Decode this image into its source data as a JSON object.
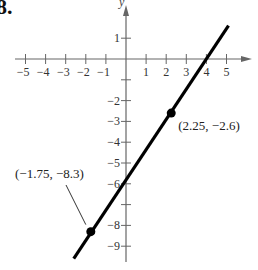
{
  "problem_number": "8.",
  "chart_data": {
    "type": "line",
    "title": "",
    "xlabel": "",
    "ylabel": "y",
    "xlim": [
      -5.5,
      5.5
    ],
    "ylim": [
      -9.5,
      1.5
    ],
    "x_ticks": [
      -5,
      -4,
      -3,
      -2,
      -1,
      1,
      2,
      3,
      4,
      5
    ],
    "x_tick_labels": [
      "−5",
      "−4",
      "−3",
      "−2",
      "−1",
      "1",
      "2",
      "3",
      "4",
      "5"
    ],
    "y_ticks": [
      1,
      -1,
      -2,
      -3,
      -4,
      -5,
      -6,
      -7,
      -8,
      -9
    ],
    "y_tick_labels": [
      "1",
      "",
      "−2",
      "−3",
      "−4",
      "−5",
      "−6",
      "",
      "−8",
      "−9"
    ],
    "grid": false,
    "series": [
      {
        "name": "line",
        "x": [
          -2.6,
          5.1
        ],
        "y": [
          -9.6,
          1.6
        ],
        "color": "#000000"
      }
    ],
    "points": [
      {
        "x": 2.25,
        "y": -2.6,
        "label": "(2.25, −2.6)"
      },
      {
        "x": -1.75,
        "y": -8.3,
        "label": "(−1.75, −8.3)"
      }
    ],
    "annotations": [
      "(2.25, −2.6)",
      "(−1.75, −8.3)"
    ]
  }
}
